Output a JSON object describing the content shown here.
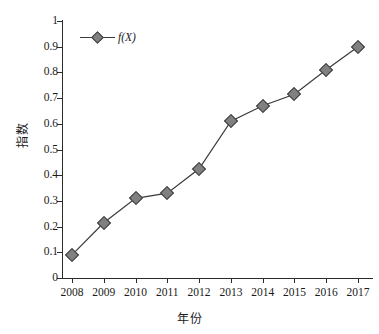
{
  "chart_data": {
    "type": "line",
    "title": "",
    "xlabel": "年份",
    "ylabel": "指数",
    "categories": [
      "2008",
      "2009",
      "2010",
      "2011",
      "2012",
      "2013",
      "2014",
      "2015",
      "2016",
      "2017"
    ],
    "series": [
      {
        "name": "f(X)",
        "values": [
          0.09,
          0.215,
          0.31,
          0.33,
          0.425,
          0.61,
          0.67,
          0.715,
          0.81,
          0.9
        ]
      }
    ],
    "ylim": [
      0,
      1
    ],
    "yticks": [
      "0",
      "0.1",
      "0.2",
      "0.3",
      "0.4",
      "0.5",
      "0.6",
      "0.7",
      "0.8",
      "0.9",
      "1"
    ],
    "ytick_values": [
      0,
      0.1,
      0.2,
      0.3,
      0.4,
      0.5,
      0.6,
      0.7,
      0.8,
      0.9,
      1
    ],
    "xlim": [
      "2008",
      "2017"
    ],
    "grid": false,
    "legend_position": "top-left",
    "marker": "diamond",
    "marker_color": "#808080",
    "marker_edge_color": "#3a3a3a",
    "line_color": "#3a3a3a"
  },
  "legend": {
    "label": "f(X)"
  }
}
